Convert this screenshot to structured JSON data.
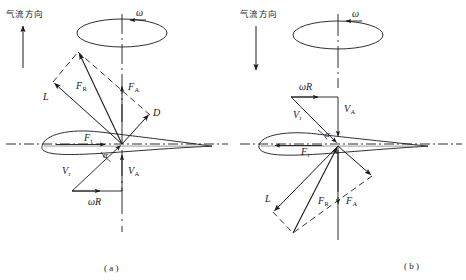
{
  "figure": {
    "caption_a": "( a )",
    "caption_b": "( b )"
  },
  "colors": {
    "stroke": "#1a1a1a",
    "background": "#ffffff"
  },
  "panels": [
    {
      "id": "a",
      "caption": "( a )",
      "flow_label": "气流方向",
      "flow_direction": "up",
      "omega_label": "ω",
      "rotation_arrow_direction": "left",
      "labels": {
        "lift": "L",
        "drag": "D",
        "resultant": "F",
        "resultant_sub": "R",
        "axial_force": "F",
        "axial_force_sub": "A",
        "tangential_force": "F",
        "tangential_force_sub": "t",
        "relative_velocity": "V",
        "relative_velocity_sub": "r",
        "axial_velocity": "V",
        "axial_velocity_sub": "A",
        "tangential_velocity": "ωR",
        "angle_of_attack": "α"
      },
      "forces_side": "above",
      "velocity_side": "below",
      "tangential_force_direction": "right",
      "tangential_velocity_direction": "right"
    },
    {
      "id": "b",
      "caption": "( b )",
      "flow_label": "气流方向",
      "flow_direction": "down",
      "omega_label": "ω",
      "rotation_arrow_direction": "left",
      "labels": {
        "lift": "L",
        "drag": "D",
        "resultant": "F",
        "resultant_sub": "R",
        "axial_force": "F",
        "axial_force_sub": "A",
        "tangential_force": "F",
        "tangential_force_sub": "t",
        "relative_velocity": "V",
        "relative_velocity_sub": "r",
        "axial_velocity": "V",
        "axial_velocity_sub": "A",
        "tangential_velocity": "ωR",
        "angle_of_attack": "α"
      },
      "forces_side": "below",
      "velocity_side": "above",
      "tangential_force_direction": "left",
      "tangential_velocity_direction": "right"
    }
  ]
}
